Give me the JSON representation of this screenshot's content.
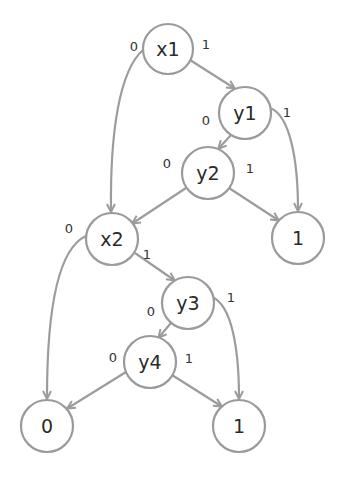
{
  "diagram": {
    "type": "binary-decision-diagram",
    "nodes": [
      {
        "id": "x1",
        "label": "x1",
        "cx": 168,
        "cy": 49
      },
      {
        "id": "y1",
        "label": "y1",
        "cx": 245,
        "cy": 113
      },
      {
        "id": "y2",
        "label": "y2",
        "cx": 208,
        "cy": 173
      },
      {
        "id": "x2",
        "label": "x2",
        "cx": 112,
        "cy": 239
      },
      {
        "id": "t1a",
        "label": "1",
        "cx": 298,
        "cy": 238
      },
      {
        "id": "y3",
        "label": "y3",
        "cx": 188,
        "cy": 303
      },
      {
        "id": "y4",
        "label": "y4",
        "cx": 150,
        "cy": 362
      },
      {
        "id": "t0",
        "label": "0",
        "cx": 47,
        "cy": 426
      },
      {
        "id": "t1b",
        "label": "1",
        "cx": 239,
        "cy": 426
      }
    ],
    "edges": [
      {
        "from": "x1",
        "to": "x2",
        "label": "0",
        "label_x": 134,
        "label_y": 46
      },
      {
        "from": "x1",
        "to": "y1",
        "label": "1",
        "label_x": 206,
        "label_y": 44
      },
      {
        "from": "y1",
        "to": "y2",
        "label": "0",
        "label_x": 206,
        "label_y": 120
      },
      {
        "from": "y1",
        "to": "t1a",
        "label": "1",
        "label_x": 287,
        "label_y": 112
      },
      {
        "from": "y2",
        "to": "x2",
        "label": "0",
        "label_x": 167,
        "label_y": 163
      },
      {
        "from": "y2",
        "to": "t1a",
        "label": "1",
        "label_x": 250,
        "label_y": 168
      },
      {
        "from": "x2",
        "to": "t0",
        "label": "0",
        "label_x": 69,
        "label_y": 228
      },
      {
        "from": "x2",
        "to": "y3",
        "label": "1",
        "label_x": 147,
        "label_y": 254
      },
      {
        "from": "y3",
        "to": "y4",
        "label": "0",
        "label_x": 151,
        "label_y": 311
      },
      {
        "from": "y3",
        "to": "t1b",
        "label": "1",
        "label_x": 231,
        "label_y": 297
      },
      {
        "from": "y4",
        "to": "t0",
        "label": "0",
        "label_x": 113,
        "label_y": 357
      },
      {
        "from": "y4",
        "to": "t1b",
        "label": "1",
        "label_x": 189,
        "label_y": 358
      }
    ]
  },
  "colors": {
    "stroke": "#9a9a9a",
    "text": "#2a2a2a",
    "background": "#ffffff"
  }
}
